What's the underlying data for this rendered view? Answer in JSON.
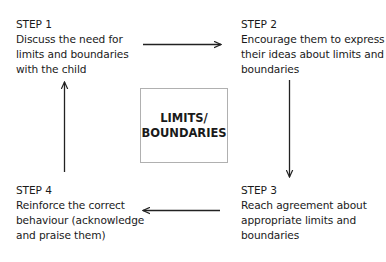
{
  "diagram": {
    "center": {
      "line1": "LIMITS/",
      "line2": "BOUNDARIES"
    },
    "steps": [
      {
        "title": "STEP 1",
        "lines": [
          "Discuss the need for",
          "limits and boundaries",
          "with the child"
        ]
      },
      {
        "title": "STEP 2",
        "lines": [
          "Encourage them to express",
          "their ideas about limits and",
          "boundaries"
        ]
      },
      {
        "title": "STEP 3",
        "lines": [
          "Reach agreement about",
          "appropriate limits and",
          "boundaries"
        ]
      },
      {
        "title": "STEP 4",
        "lines": [
          "Reinforce the correct",
          "behaviour (acknowledge",
          "and praise them)"
        ]
      }
    ],
    "arrows": [
      {
        "from": "STEP 1",
        "to": "STEP 2",
        "direction": "right"
      },
      {
        "from": "STEP 2",
        "to": "STEP 3",
        "direction": "down"
      },
      {
        "from": "STEP 3",
        "to": "STEP 4",
        "direction": "left"
      },
      {
        "from": "STEP 4",
        "to": "STEP 1",
        "direction": "up"
      }
    ],
    "colors": {
      "text": "#1a1a1a",
      "arrow": "#222222",
      "box_border": "#b0b0b0"
    }
  }
}
